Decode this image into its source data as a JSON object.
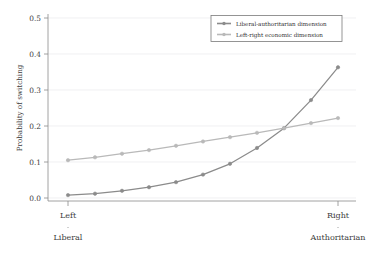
{
  "chart_data": {
    "type": "line",
    "title": "",
    "xlabel": "",
    "ylabel": "Probability of switching",
    "ylim": [
      0.0,
      0.5
    ],
    "yticks": [
      "0.0",
      "0.1",
      "0.2",
      "0.3",
      "0.4",
      "0.5"
    ],
    "ytick_values": [
      0.0,
      0.1,
      0.2,
      0.3,
      0.4,
      0.5
    ],
    "grid": true,
    "legend_position": "top-right",
    "x": [
      0,
      1,
      2,
      3,
      4,
      5,
      6,
      7,
      8,
      9,
      10
    ],
    "x_axis_endpoints": {
      "left_line1": "Left",
      "left_line2": "Liberal",
      "right_line1": "Right",
      "right_line2": "Authoritarian"
    },
    "series": [
      {
        "name": "Liberal-authoritarian dimension",
        "color": "#8b8b8b",
        "values": [
          0.008,
          0.012,
          0.02,
          0.03,
          0.044,
          0.065,
          0.095,
          0.139,
          0.194,
          0.272,
          0.363
        ]
      },
      {
        "name": "Left-right economic dimension",
        "color": "#b9b9b9",
        "values": [
          0.105,
          0.113,
          0.123,
          0.133,
          0.145,
          0.157,
          0.169,
          0.181,
          0.194,
          0.208,
          0.222
        ]
      }
    ]
  },
  "axis": {
    "y_title": "Probability of switching"
  },
  "legend": {
    "items": [
      {
        "label": "Liberal-authoritarian dimension",
        "color": "#8b8b8b"
      },
      {
        "label": "Left-right economic dimension",
        "color": "#b9b9b9"
      }
    ]
  },
  "colors": {
    "axis": "#8a8a8a",
    "grid": "#e9e9ec",
    "text": "#3d3d3d",
    "series_dark": "#8b8b8b",
    "series_light": "#b9b9b9",
    "background": "#ffffff"
  }
}
